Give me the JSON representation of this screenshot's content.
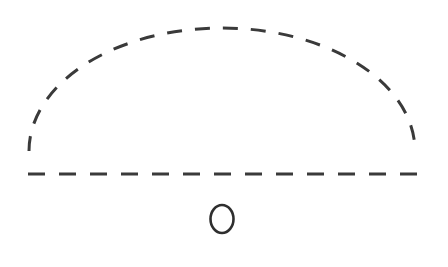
{
  "canvas": {
    "width": 448,
    "height": 267,
    "background_color": "#ffffff"
  },
  "figure": {
    "title": "",
    "stroke_color": "#3a3a3a",
    "elements": [
      {
        "id": "dashed-arc",
        "kind": "arc",
        "label": "dashed semicircular arc",
        "center_x": 222,
        "center_y": 151,
        "radius_x": 193,
        "radius_y": 123,
        "start_angle_deg": 180,
        "end_angle_deg": 360,
        "stroke_width": 3,
        "dash_length": 15,
        "gap_length": 13,
        "stroke_color": "#3a3a3a"
      },
      {
        "id": "dashed-baseline",
        "kind": "line",
        "label": "dashed horizontal baseline",
        "x1": 28,
        "y1": 174,
        "x2": 418,
        "y2": 174,
        "stroke_width": 3,
        "dash_length": 17,
        "gap_length": 14,
        "stroke_color": "#3a3a3a"
      },
      {
        "id": "letter-o-circle",
        "kind": "ellipse",
        "label": "O",
        "center_x": 222,
        "center_y": 219,
        "radius_x": 11.5,
        "radius_y": 14,
        "stroke_width": 2.6,
        "fill": "none",
        "stroke_color": "#2f2f2f"
      }
    ]
  }
}
